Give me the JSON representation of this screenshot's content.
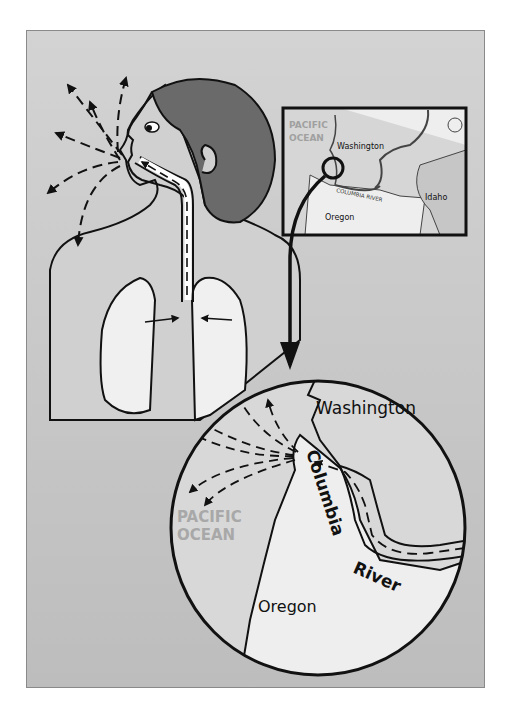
{
  "figure": {
    "title": ""
  },
  "inset_map": {
    "labels": {
      "ocean": [
        "PACIFIC",
        "OCEAN"
      ],
      "washington": "Washington",
      "river": "COLUMBIA RIVER",
      "idaho": "Idaho",
      "oregon": "Oregon"
    }
  },
  "zoom_map": {
    "labels": {
      "washington": "Washington",
      "ocean": [
        "PACIFIC",
        "OCEAN"
      ],
      "oregon": "Oregon",
      "river_word1": "Columbia",
      "river_word2": "River"
    }
  },
  "colors": {
    "background": "#c8c8c8",
    "frame_border": "#8a8a8a",
    "hair": "#6a6a6a",
    "skin": "#d0d0d0",
    "lungs": "#f0f0f0",
    "land_light": "#eeeeee",
    "ocean_text": "#a8a8a8",
    "stroke": "#111111"
  }
}
